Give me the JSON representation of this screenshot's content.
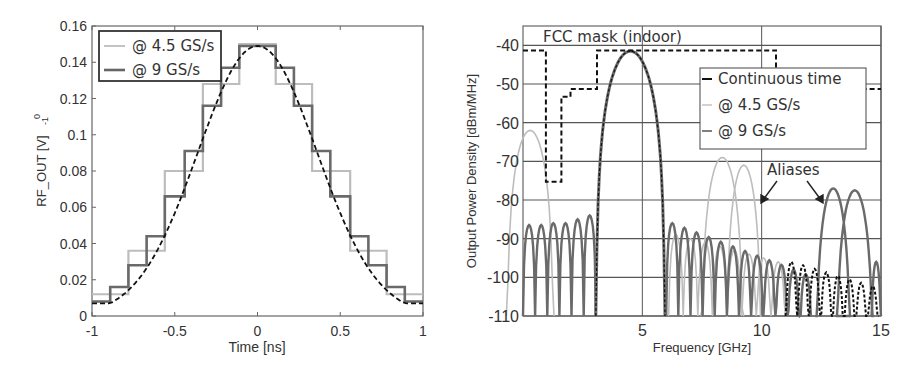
{
  "chart_data": [
    {
      "type": "line",
      "title": "",
      "xlabel": "Time [ns]",
      "ylabel": "RF_OUT [V]",
      "ylabel_artifact": "-1 0",
      "xlim": [
        -1,
        1
      ],
      "ylim": [
        0,
        0.16
      ],
      "xticks": [
        "-1",
        "-0.5",
        "0",
        "0.5",
        "1"
      ],
      "yticks": [
        "0",
        "0.02",
        "0.04",
        "0.06",
        "0.08",
        "0.1",
        "0.12",
        "0.14",
        "0.16"
      ],
      "grid": false,
      "legend_position": "upper left",
      "legend": [
        "@ 4.5 GS/s",
        "@ 9 GS/s"
      ],
      "series": [
        {
          "name": "Continuous time",
          "style": "dashed black",
          "x": [
            -1,
            -0.9,
            -0.8,
            -0.7,
            -0.6,
            -0.5,
            -0.4,
            -0.3,
            -0.2,
            -0.1,
            0,
            0.1,
            0.2,
            0.3,
            0.4,
            0.5,
            0.6,
            0.7,
            0.8,
            0.9,
            1
          ],
          "y": [
            0.007,
            0.011,
            0.017,
            0.026,
            0.038,
            0.054,
            0.072,
            0.092,
            0.112,
            0.132,
            0.149,
            0.147,
            0.132,
            0.112,
            0.092,
            0.072,
            0.054,
            0.038,
            0.026,
            0.017,
            0.008
          ]
        },
        {
          "name": "@ 4.5 GS/s",
          "style": "light gray step",
          "step_edges": [
            -1,
            -0.78,
            -0.56,
            -0.33,
            -0.11,
            0.11,
            0.33,
            0.56,
            0.78,
            1
          ],
          "y": [
            0.012,
            0.036,
            0.08,
            0.128,
            0.15,
            0.128,
            0.08,
            0.036,
            0.012
          ]
        },
        {
          "name": "@ 9 GS/s",
          "style": "dark gray step",
          "step_edges": [
            -1,
            -0.89,
            -0.78,
            -0.67,
            -0.56,
            -0.44,
            -0.33,
            -0.22,
            -0.11,
            0,
            0.11,
            0.22,
            0.33,
            0.44,
            0.56,
            0.67,
            0.78,
            0.89,
            1
          ],
          "y": [
            0.008,
            0.016,
            0.028,
            0.044,
            0.066,
            0.091,
            0.116,
            0.137,
            0.149,
            0.149,
            0.137,
            0.116,
            0.091,
            0.066,
            0.044,
            0.028,
            0.016,
            0.008
          ]
        }
      ]
    },
    {
      "type": "line",
      "title": "",
      "xlabel": "Frequency [GHz]",
      "ylabel": "Output Power Density [dBm/MHz]",
      "xlim": [
        0,
        15
      ],
      "ylim": [
        -110,
        -35
      ],
      "xticks": [
        "5",
        "10",
        "15"
      ],
      "yticks": [
        "-40",
        "-50",
        "-60",
        "-70",
        "-80",
        "-90",
        "-100",
        "-110"
      ],
      "grid": true,
      "legend_position": "upper right (inset)",
      "legend": [
        "Continuous time",
        "@ 4.5 GS/s",
        "@ 9 GS/s"
      ],
      "annotations": [
        {
          "text": "FCC mask (indoor)",
          "x": 2.5,
          "y": -38
        },
        {
          "text": "Aliases",
          "x": 11.2,
          "y": -74,
          "arrows_to": [
            [
              9.9,
              -80
            ],
            [
              12.7,
              -80
            ]
          ]
        }
      ],
      "fcc_mask": {
        "style": "dashed black",
        "points": [
          [
            0,
            -41.3
          ],
          [
            0.96,
            -41.3
          ],
          [
            0.96,
            -75.3
          ],
          [
            1.61,
            -75.3
          ],
          [
            1.61,
            -53.3
          ],
          [
            1.99,
            -53.3
          ],
          [
            1.99,
            -51.3
          ],
          [
            3.1,
            -51.3
          ],
          [
            3.1,
            -41.3
          ],
          [
            10.6,
            -41.3
          ],
          [
            10.6,
            -51.3
          ],
          [
            15,
            -51.3
          ]
        ]
      },
      "series": [
        {
          "name": "Continuous time",
          "style": "dashed black",
          "main_lobe": {
            "center_ghz": 4.5,
            "peak_dbm": -41.5,
            "null_left_ghz": 3.1,
            "null_right_ghz": 6.0
          },
          "sidelobe_peaks_dbm": [
            -86,
            -87,
            -88,
            -89,
            -90,
            -92,
            -93,
            -94,
            -95,
            -96,
            -97,
            -98,
            -99,
            -100,
            -101,
            -102
          ]
        },
        {
          "name": "@ 4.5 GS/s",
          "style": "light gray",
          "main_lobe": {
            "center_ghz": 4.5,
            "peak_dbm": -41.5
          },
          "image_peaks": [
            {
              "x": 0.3,
              "y": -62
            },
            {
              "x": 8.3,
              "y": -69
            },
            {
              "x": 9.3,
              "y": -71
            }
          ]
        },
        {
          "name": "@ 9 GS/s",
          "style": "dark gray",
          "main_lobe": {
            "center_ghz": 4.5,
            "peak_dbm": -41.5
          },
          "lobes_left_dbm": [
            -86.5,
            -86.5,
            -86,
            -86,
            -85,
            -84
          ],
          "image_peaks": [
            {
              "x": 13.0,
              "y": -77
            },
            {
              "x": 13.9,
              "y": -77.5
            }
          ]
        }
      ]
    }
  ],
  "left": {
    "xlabel": "Time [ns]",
    "ylabel": "RF_OUT [V]",
    "ylabel_sub": "-1",
    "ylabel_sup": "0",
    "xticks": [
      "-1",
      "-0.5",
      "0",
      "0.5",
      "1"
    ],
    "yticks": [
      "0",
      "0.02",
      "0.04",
      "0.06",
      "0.08",
      "0.1",
      "0.12",
      "0.14",
      "0.16"
    ],
    "legend": [
      "@ 4.5 GS/s",
      "@ 9 GS/s"
    ]
  },
  "right": {
    "xlabel": "Frequency [GHz]",
    "ylabel": "Output Power Density [dBm/MHz]",
    "xticks": [
      "5",
      "10",
      "15"
    ],
    "yticks": [
      "-40",
      "-50",
      "-60",
      "-70",
      "-80",
      "-90",
      "-100",
      "-110"
    ],
    "legend": [
      "Continuous time",
      "@ 4.5 GS/s",
      "@ 9 GS/s"
    ],
    "mask_label": "FCC mask (indoor)",
    "aliases_label": "Aliases"
  },
  "colors": {
    "axis": "#555555",
    "grid": "#555555",
    "continuous": "#111111",
    "rate_4_5": "#bdbdbd",
    "rate_9": "#6a6a6a",
    "text": "#333333"
  }
}
